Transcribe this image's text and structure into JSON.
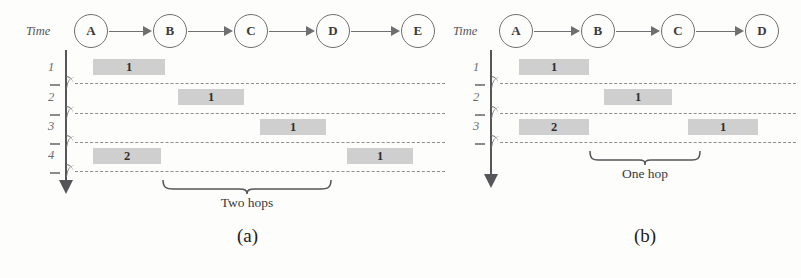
{
  "figure": {
    "background_color": "#fdfdfb",
    "line_color": "#6f6f72",
    "packet_color": "#cfcfcf",
    "dash_color": "#8d8d93"
  },
  "panel_a": {
    "caption": "(a)",
    "time_axis_label": "Time",
    "nodes": [
      {
        "label": "A",
        "x": 91
      },
      {
        "label": "B",
        "x": 170
      },
      {
        "label": "C",
        "x": 251
      },
      {
        "label": "D",
        "x": 333
      },
      {
        "label": "E",
        "x": 418
      }
    ],
    "arrows": [
      {
        "from": "A",
        "to": "B"
      },
      {
        "from": "B",
        "to": "C"
      },
      {
        "from": "C",
        "to": "D"
      },
      {
        "from": "D",
        "to": "E"
      }
    ],
    "time_ticks": [
      "1",
      "2",
      "3",
      "4"
    ],
    "packets": [
      {
        "row": "1",
        "value": "1",
        "x": 93,
        "width": 72,
        "at_node": "A"
      },
      {
        "row": "2",
        "value": "1",
        "x": 178,
        "width": 66,
        "at_node": "B"
      },
      {
        "row": "3",
        "value": "1",
        "x": 260,
        "width": 66,
        "at_node": "C"
      },
      {
        "row": "4",
        "value": "2",
        "x": 93,
        "width": 68,
        "at_node": "A"
      },
      {
        "row": "4",
        "value": "1",
        "x": 347,
        "width": 66,
        "at_node": "D"
      }
    ],
    "brace_label": "Two hops",
    "brace_start": 163,
    "brace_end": 331
  },
  "panel_b": {
    "caption": "(b)",
    "time_axis_label": "Time",
    "nodes": [
      {
        "label": "A",
        "x": 516
      },
      {
        "label": "B",
        "x": 598
      },
      {
        "label": "C",
        "x": 678
      },
      {
        "label": "D",
        "x": 762
      }
    ],
    "arrows": [
      {
        "from": "A",
        "to": "B"
      },
      {
        "from": "B",
        "to": "C"
      },
      {
        "from": "C",
        "to": "D"
      }
    ],
    "time_ticks": [
      "1",
      "2",
      "3"
    ],
    "packets": [
      {
        "row": "1",
        "value": "1",
        "x": 519,
        "width": 70,
        "at_node": "A"
      },
      {
        "row": "2",
        "value": "1",
        "x": 604,
        "width": 68,
        "at_node": "B"
      },
      {
        "row": "3",
        "value": "2",
        "x": 519,
        "width": 70,
        "at_node": "A"
      },
      {
        "row": "3",
        "value": "1",
        "x": 688,
        "width": 70,
        "at_node": "C"
      }
    ],
    "brace_label": "One hop",
    "brace_start": 590,
    "brace_end": 700
  }
}
